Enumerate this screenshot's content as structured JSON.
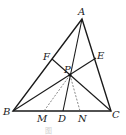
{
  "figure": {
    "type": "geometry-triangle",
    "caption": "图",
    "points": {
      "A": {
        "label": "A",
        "x": 82,
        "y": 19
      },
      "B": {
        "label": "B",
        "x": 13,
        "y": 111
      },
      "C": {
        "label": "C",
        "x": 111,
        "y": 111
      },
      "P": {
        "label": "P",
        "x": 70,
        "y": 75
      },
      "F": {
        "label": "F",
        "x": 52,
        "y": 59
      },
      "E": {
        "label": "E",
        "x": 96,
        "y": 58
      },
      "D": {
        "label": "D",
        "x": 63,
        "y": 111
      },
      "M": {
        "label": "M",
        "x": 44,
        "y": 111
      },
      "N": {
        "label": "N",
        "x": 80,
        "y": 111
      }
    },
    "segments_solid": [
      "AB",
      "BC",
      "CA",
      "AD",
      "BE",
      "CF"
    ],
    "segments_dashed": [
      "PM",
      "PN"
    ]
  }
}
